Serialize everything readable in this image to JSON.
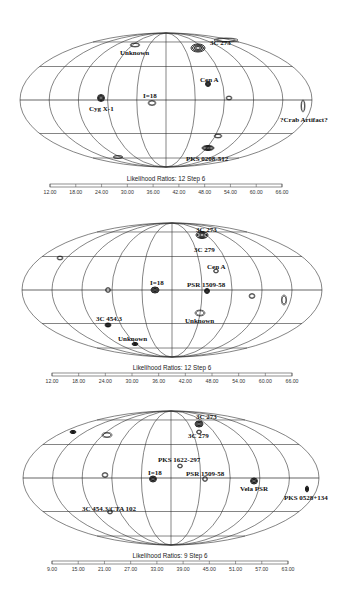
{
  "chart_data": [
    {
      "type": "heatmap",
      "projection": "aitoff-galactic",
      "title": "",
      "colorbar": {
        "title": "Likelihood Ratios: 12 Step 6",
        "ticks": [
          "12.00",
          "18.00",
          "24.00",
          "30.00",
          "36.00",
          "42.00",
          "48.00",
          "54.00",
          "60.00",
          "66.00"
        ],
        "range": [
          12,
          66
        ],
        "step": 6
      },
      "sources": [
        {
          "name": "3C 273",
          "x": 210,
          "y": 40
        },
        {
          "name": "Unknown",
          "x": 120,
          "y": 50
        },
        {
          "name": "Cen A",
          "x": 200,
          "y": 77
        },
        {
          "name": "I=18",
          "x": 143,
          "y": 93
        },
        {
          "name": "Cyg X-1",
          "x": 89,
          "y": 106
        },
        {
          "name": "?Crab Artifact?",
          "x": 280,
          "y": 117
        },
        {
          "name": "PKS 0208-512",
          "x": 186,
          "y": 156
        }
      ]
    },
    {
      "type": "heatmap",
      "projection": "aitoff-galactic",
      "title": "",
      "colorbar": {
        "title": "Likelihood Ratios: 12 Step 6",
        "ticks": [
          "12.00",
          "18.00",
          "24.00",
          "30.00",
          "36.00",
          "42.00",
          "48.00",
          "54.00",
          "60.00",
          "66.00"
        ],
        "range": [
          12,
          66
        ],
        "step": 6
      },
      "sources": [
        {
          "name": "3C 273",
          "x": 196,
          "y": 227
        },
        {
          "name": "3C 279",
          "x": 194,
          "y": 247
        },
        {
          "name": "Cen A",
          "x": 207,
          "y": 264
        },
        {
          "name": "I=18",
          "x": 150,
          "y": 280
        },
        {
          "name": "PSR 1509-58",
          "x": 187,
          "y": 282
        },
        {
          "name": "3C 454.3",
          "x": 96,
          "y": 316
        },
        {
          "name": "Unknown",
          "x": 185,
          "y": 318
        },
        {
          "name": "Unknown",
          "x": 118,
          "y": 336
        }
      ]
    },
    {
      "type": "heatmap",
      "projection": "aitoff-galactic",
      "title": "",
      "colorbar": {
        "title": "Likelihood Ratios: 9 Step 6",
        "ticks": [
          "9.00",
          "15.00",
          "21.00",
          "27.00",
          "33.00",
          "39.00",
          "45.00",
          "51.00",
          "57.00",
          "63.00"
        ],
        "range": [
          9,
          63
        ],
        "step": 6
      },
      "sources": [
        {
          "name": "3C 273",
          "x": 196,
          "y": 414
        },
        {
          "name": "3C 279",
          "x": 188,
          "y": 433
        },
        {
          "name": "PKS 1622-297",
          "x": 158,
          "y": 457
        },
        {
          "name": "I=18",
          "x": 148,
          "y": 470
        },
        {
          "name": "PSR 1509-58",
          "x": 186,
          "y": 471
        },
        {
          "name": "Vela PSR",
          "x": 240,
          "y": 486
        },
        {
          "name": "PKS 0528+134",
          "x": 284,
          "y": 495
        },
        {
          "name": "3C 454.3/CTA 102",
          "x": 82,
          "y": 506
        }
      ]
    }
  ],
  "maps": [
    {
      "cx": 166,
      "cy": 100,
      "rx": 146,
      "ry": 67,
      "cb": {
        "x": 50,
        "y": 184,
        "w": 232,
        "title_y": 176,
        "tick_y": 190
      },
      "blobs": [
        {
          "x": 198,
          "y": 48,
          "rx": 7,
          "ry": 4,
          "heavy": true
        },
        {
          "x": 135,
          "y": 45,
          "rx": 5,
          "ry": 2,
          "heavy": false
        },
        {
          "x": 208,
          "y": 84,
          "rx": 2.5,
          "ry": 2.5,
          "heavy": true
        },
        {
          "x": 152,
          "y": 103,
          "rx": 4,
          "ry": 2.5,
          "heavy": false
        },
        {
          "x": 101,
          "y": 98,
          "rx": 3.5,
          "ry": 3.5,
          "heavy": true
        },
        {
          "x": 303,
          "y": 106,
          "rx": 2,
          "ry": 6,
          "heavy": false
        },
        {
          "x": 208,
          "y": 148,
          "rx": 6,
          "ry": 2.5,
          "heavy": true
        },
        {
          "x": 218,
          "y": 136,
          "rx": 4,
          "ry": 2,
          "heavy": false
        },
        {
          "x": 229,
          "y": 98,
          "rx": 3,
          "ry": 2,
          "heavy": false
        },
        {
          "x": 118,
          "y": 157,
          "rx": 5,
          "ry": 1.5,
          "heavy": false
        },
        {
          "x": 226,
          "y": 40,
          "rx": 12,
          "ry": 2,
          "heavy": false
        }
      ]
    },
    {
      "cx": 172,
      "cy": 290,
      "rx": 150,
      "ry": 67,
      "cb": {
        "x": 52,
        "y": 373,
        "w": 240,
        "title_y": 365,
        "tick_y": 379
      },
      "blobs": [
        {
          "x": 202,
          "y": 235,
          "rx": 6,
          "ry": 3.5,
          "heavy": true
        },
        {
          "x": 216,
          "y": 271,
          "rx": 2.5,
          "ry": 2,
          "heavy": false
        },
        {
          "x": 155,
          "y": 290,
          "rx": 4,
          "ry": 3,
          "heavy": true
        },
        {
          "x": 207,
          "y": 291,
          "rx": 2.5,
          "ry": 2.5,
          "heavy": true
        },
        {
          "x": 108,
          "y": 325,
          "rx": 3,
          "ry": 2,
          "heavy": true
        },
        {
          "x": 200,
          "y": 313,
          "rx": 5,
          "ry": 3,
          "heavy": false
        },
        {
          "x": 135,
          "y": 344,
          "rx": 3,
          "ry": 1.5,
          "heavy": true
        },
        {
          "x": 284,
          "y": 300,
          "rx": 2.5,
          "ry": 5,
          "heavy": false
        },
        {
          "x": 252,
          "y": 296,
          "rx": 3,
          "ry": 2.5,
          "heavy": false
        },
        {
          "x": 108,
          "y": 290,
          "rx": 2.5,
          "ry": 2.5,
          "heavy": false
        },
        {
          "x": 60,
          "y": 258,
          "rx": 3,
          "ry": 2,
          "heavy": false
        }
      ]
    },
    {
      "cx": 171,
      "cy": 478,
      "rx": 148,
      "ry": 67,
      "cb": {
        "x": 52,
        "y": 561,
        "w": 236,
        "title_y": 553,
        "tick_y": 567
      },
      "blobs": [
        {
          "x": 199,
          "y": 424,
          "rx": 4,
          "ry": 3,
          "heavy": true
        },
        {
          "x": 199,
          "y": 432,
          "rx": 2.5,
          "ry": 2,
          "heavy": false
        },
        {
          "x": 180,
          "y": 466,
          "rx": 2.5,
          "ry": 2,
          "heavy": false
        },
        {
          "x": 153,
          "y": 479,
          "rx": 3.5,
          "ry": 3,
          "heavy": true
        },
        {
          "x": 205,
          "y": 479,
          "rx": 2.5,
          "ry": 2.5,
          "heavy": false
        },
        {
          "x": 254,
          "y": 481,
          "rx": 3.5,
          "ry": 3,
          "heavy": true
        },
        {
          "x": 307,
          "y": 489,
          "rx": 1.5,
          "ry": 3,
          "heavy": true
        },
        {
          "x": 110,
          "y": 512,
          "rx": 2.5,
          "ry": 2,
          "heavy": false
        },
        {
          "x": 105,
          "y": 475,
          "rx": 3,
          "ry": 2.5,
          "heavy": false
        },
        {
          "x": 107,
          "y": 435,
          "rx": 5,
          "ry": 2.5,
          "heavy": false
        },
        {
          "x": 73,
          "y": 432,
          "rx": 3,
          "ry": 1.5,
          "heavy": true
        }
      ]
    }
  ]
}
